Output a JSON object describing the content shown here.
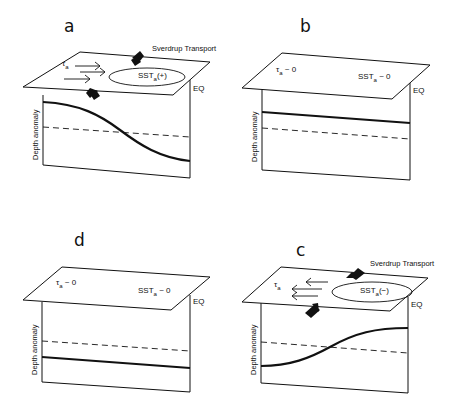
{
  "figure": {
    "colors": {
      "line": "#111111",
      "background": "#ffffff"
    },
    "common": {
      "y_axis_label": "Depth anomaly",
      "eq_label": "EQ"
    },
    "panels": [
      {
        "id": "a",
        "label": "a",
        "wind_label": "τ",
        "wind_sub": "a",
        "wind_direction": "eastward",
        "sst_label": "SST",
        "sst_sub": "a",
        "sst_value": "(+)",
        "sst_has_ellipse": true,
        "transport_label": "Sverdrup Transport",
        "transport_direction": "poleward",
        "thermocline": "deep-west-shallow-east-decreasing"
      },
      {
        "id": "b",
        "label": "b",
        "wind_label": "τ",
        "wind_sub": "a",
        "wind_value": " ~ 0",
        "sst_label": "SST",
        "sst_sub": "a",
        "sst_value": " ~ 0",
        "thermocline": "flat-above-mean"
      },
      {
        "id": "c",
        "label": "c",
        "wind_label": "τ",
        "wind_sub": "a",
        "wind_direction": "westward",
        "sst_label": "SST",
        "sst_sub": "a",
        "sst_value": "(−)",
        "sst_has_ellipse": true,
        "transport_label": "Sverdrup Transport",
        "transport_direction": "equatorward",
        "thermocline": "shallow-west-deep-east-increasing"
      },
      {
        "id": "d",
        "label": "d",
        "wind_label": "τ",
        "wind_sub": "a",
        "wind_value": " ~ 0",
        "sst_label": "SST",
        "sst_sub": "a",
        "sst_value": " ~ 0",
        "thermocline": "flat-below-mean"
      }
    ]
  }
}
